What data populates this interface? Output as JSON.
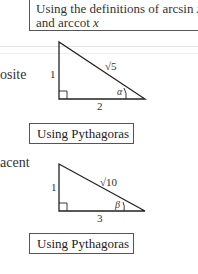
{
  "top_box": {
    "line1": "Using the definitions of arcsin ",
    "var1": "x",
    "line2": "and arccot ",
    "var2": "x"
  },
  "side_labels": {
    "opposite_fragment": "osite",
    "adjacent_fragment": "acent"
  },
  "triangle1": {
    "vertical_side": "1",
    "horizontal_side": "2",
    "hypotenuse": "√5",
    "angle": "α"
  },
  "triangle2": {
    "vertical_side": "1",
    "horizontal_side": "3",
    "hypotenuse": "√10",
    "angle": "β"
  },
  "boxes": {
    "pythagoras1": "Using Pythagoras",
    "pythagoras2": "Using Pythagoras"
  }
}
